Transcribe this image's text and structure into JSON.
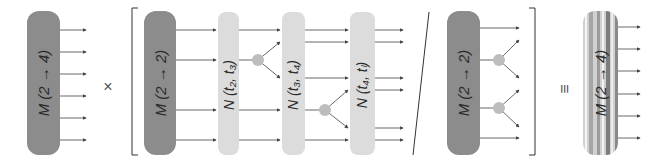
{
  "diagram": {
    "colors": {
      "dark_block": "#8c8c8c",
      "light_block": "#dcdcdc",
      "vertex": "#bdbdbd",
      "line": "#444444",
      "text": "#2a2a2a"
    },
    "blocks": {
      "lhs_m24": {
        "label": "M (2 → 4)"
      },
      "bracket_m22": {
        "label": "M (2 → 2)"
      },
      "n1": {
        "label": "N (t₂, t₃)"
      },
      "n2": {
        "label": "N (t₃, t₄)"
      },
      "n3": {
        "label": "N (t₄, tₗ)"
      },
      "denominator_m22": {
        "label": "M (2 → 2)"
      },
      "rhs_m24": {
        "label": "M (2 → 4)"
      }
    },
    "operators": {
      "times": "×",
      "divide": "/",
      "equiv": "≡"
    }
  }
}
